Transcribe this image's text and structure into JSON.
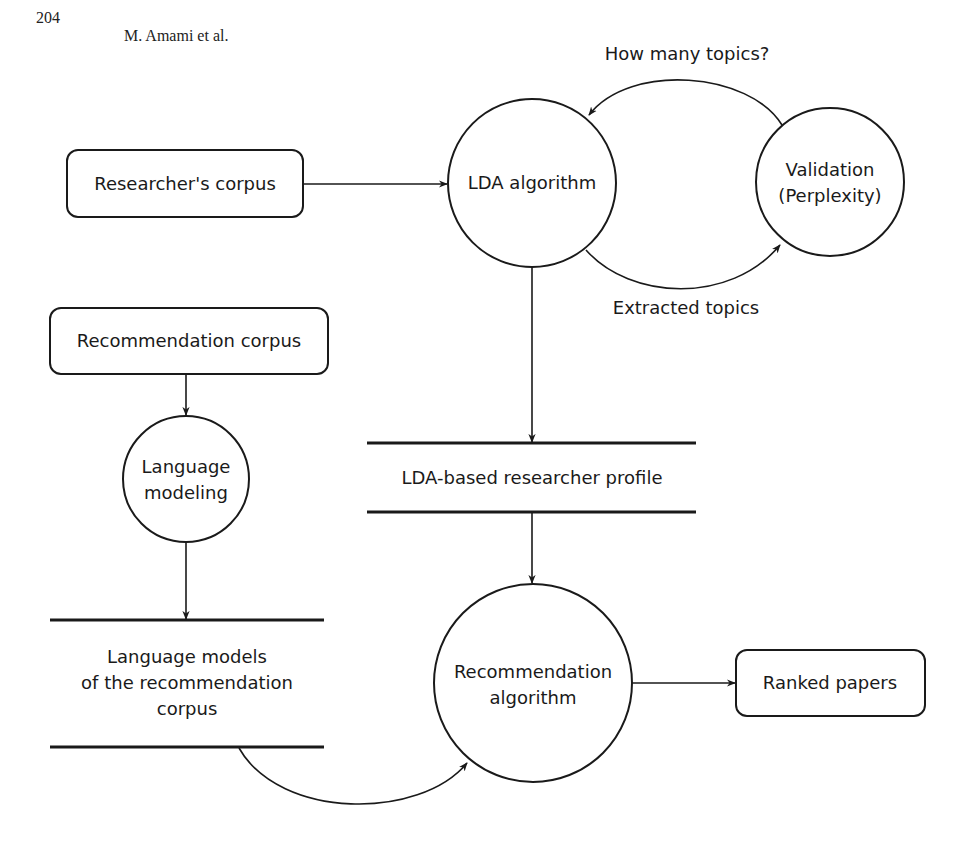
{
  "page_header": {
    "page_number": "204",
    "authors": "M. Amami et al."
  },
  "diagram": {
    "nodes": {
      "researchers_corpus": {
        "type": "rounded-box",
        "label": "Researcher's corpus"
      },
      "lda_algorithm": {
        "type": "circle",
        "label": "LDA algorithm"
      },
      "validation": {
        "type": "circle",
        "label_line1": "Validation",
        "label_line2": "(Perplexity)"
      },
      "recommendation_corpus": {
        "type": "rounded-box",
        "label": "Recommendation corpus"
      },
      "language_modeling": {
        "type": "circle",
        "label_line1": "Language",
        "label_line2": "modeling"
      },
      "lda_profile": {
        "type": "data-store",
        "label": "LDA-based researcher profile"
      },
      "language_models": {
        "type": "data-store",
        "label_line1": "Language models",
        "label_line2": "of the recommendation",
        "label_line3": "corpus"
      },
      "recommendation_algorithm": {
        "type": "circle",
        "label_line1": "Recommendation",
        "label_line2": "algorithm"
      },
      "ranked_papers": {
        "type": "rounded-box",
        "label": "Ranked papers"
      }
    },
    "edges": {
      "how_many_topics": {
        "from": "validation",
        "to": "lda_algorithm",
        "label": "How many topics?"
      },
      "extracted_topics": {
        "from": "lda_algorithm",
        "to": "validation",
        "label": "Extracted topics"
      },
      "corpus_to_lda": {
        "from": "researchers_corpus",
        "to": "lda_algorithm"
      },
      "lda_to_profile": {
        "from": "lda_algorithm",
        "to": "lda_profile"
      },
      "profile_to_rec": {
        "from": "lda_profile",
        "to": "recommendation_algorithm"
      },
      "reccorpus_to_lm": {
        "from": "recommendation_corpus",
        "to": "language_modeling"
      },
      "lm_to_models": {
        "from": "language_modeling",
        "to": "language_models"
      },
      "models_to_rec": {
        "from": "language_models",
        "to": "recommendation_algorithm"
      },
      "rec_to_ranked": {
        "from": "recommendation_algorithm",
        "to": "ranked_papers"
      }
    },
    "colors": {
      "stroke": "#1a1a1a",
      "background": "#ffffff"
    }
  }
}
